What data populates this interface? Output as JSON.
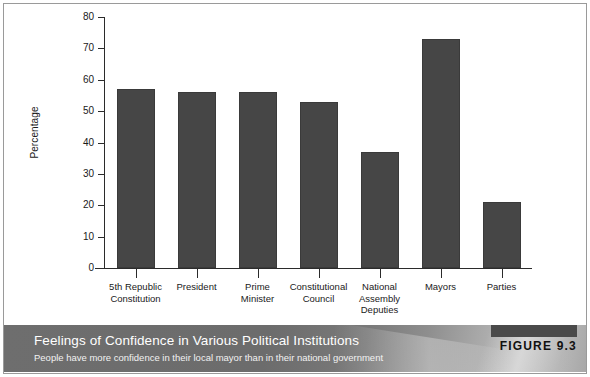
{
  "chart_data": {
    "type": "bar",
    "title": "Feelings of Confidence in Various Political Institutions",
    "subtitle": "People have more confidence in their local mayor than in their national government",
    "figure_label": "FIGURE 9.3",
    "xlabel": "",
    "ylabel": "Percentage",
    "ylim": [
      0,
      80
    ],
    "yticks": [
      0,
      10,
      20,
      30,
      40,
      50,
      60,
      70,
      80
    ],
    "grid": false,
    "legend": null,
    "bar_color": "#464646",
    "categories": [
      "5th Republic\nConstitution",
      "President",
      "Prime\nMinister",
      "Constitutional\nCouncil",
      "National\nAssembly\nDeputies",
      "Mayors",
      "Parties"
    ],
    "category_lines": [
      [
        "5th Republic",
        "Constitution"
      ],
      [
        "President"
      ],
      [
        "Prime",
        "Minister"
      ],
      [
        "Constitutional",
        "Council"
      ],
      [
        "National",
        "Assembly",
        "Deputies"
      ],
      [
        "Mayors"
      ],
      [
        "Parties"
      ]
    ],
    "values": [
      57,
      56,
      56,
      53,
      37,
      73,
      21
    ]
  },
  "axis": {
    "y_title": "Percentage",
    "y_tick_labels": [
      "80",
      "70",
      "60",
      "50",
      "40",
      "30",
      "20",
      "10",
      "0"
    ]
  },
  "caption": {
    "title": "Feelings of Confidence in Various Political Institutions",
    "subtitle": "People have more confidence in their local mayor than in their national government",
    "figure_number": "FIGURE 9.3"
  }
}
